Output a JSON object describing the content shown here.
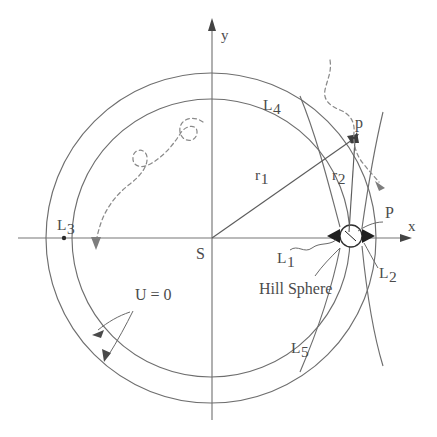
{
  "figure": {
    "background_color": "#ffffff",
    "line_color": "#6e6e6e",
    "text_color": "#4b4b4b",
    "dashed_color": "#8a8a8a"
  },
  "axes": {
    "x_label": "x",
    "y_label": "y",
    "origin_label": "S"
  },
  "labels": {
    "l1": "L",
    "l1_sub": "1",
    "l2": "L",
    "l2_sub": "2",
    "l3": "L",
    "l3_sub": "3",
    "l4": "L",
    "l4_sub": "4",
    "l5": "L",
    "l5_sub": "5",
    "r1": "r",
    "r1_sub": "1",
    "r2": "r",
    "r2_sub": "2",
    "primary": "S",
    "secondary": "P",
    "particle": "p",
    "hill_sphere": "Hill Sphere",
    "potential": "U = 0"
  },
  "geometry": {
    "center": {
      "x": 211,
      "y": 238
    },
    "outer_circle_radius": 165,
    "inner_circle_radius": 139,
    "secondary_position": {
      "x": 351,
      "y": 236
    },
    "hill_sphere_radius": 11,
    "particle_position": {
      "x": 351,
      "y": 133
    },
    "l3_position": {
      "x": 64,
      "y": 238
    }
  },
  "annotations": {
    "trajectory_spiral": "dashed inward spiral with three loops ending in arrow near L3 side",
    "trajectory_flyby": "dashed flyby path passing near particle p with arrow heading outward"
  }
}
